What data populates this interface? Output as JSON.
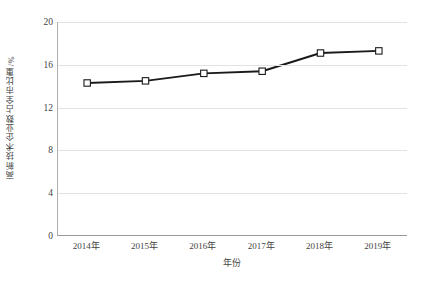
{
  "chart_data": {
    "type": "line",
    "title": "",
    "xlabel": "年份",
    "ylabel": "高新技术企业数占全市比重/%",
    "categories": [
      "2014年",
      "2015年",
      "2016年",
      "2017年",
      "2018年",
      "2019年"
    ],
    "values": [
      14.3,
      14.5,
      15.2,
      15.4,
      17.1,
      17.3
    ],
    "series": [
      {
        "name": "高新技术企业数占全市比重",
        "values": [
          14.3,
          14.5,
          15.2,
          15.4,
          17.1,
          17.3
        ]
      }
    ],
    "ylim": [
      0,
      20
    ],
    "yticks": [
      0,
      4,
      8,
      12,
      16,
      20
    ],
    "ytick_labels": [
      "0",
      "4",
      "8",
      "12",
      "16",
      "20"
    ],
    "grid": true,
    "legend": false,
    "marker": "open-square",
    "line_color": "#1a1a1a",
    "marker_fill": "#ffffff",
    "grid_color": "#e2e2e2"
  }
}
